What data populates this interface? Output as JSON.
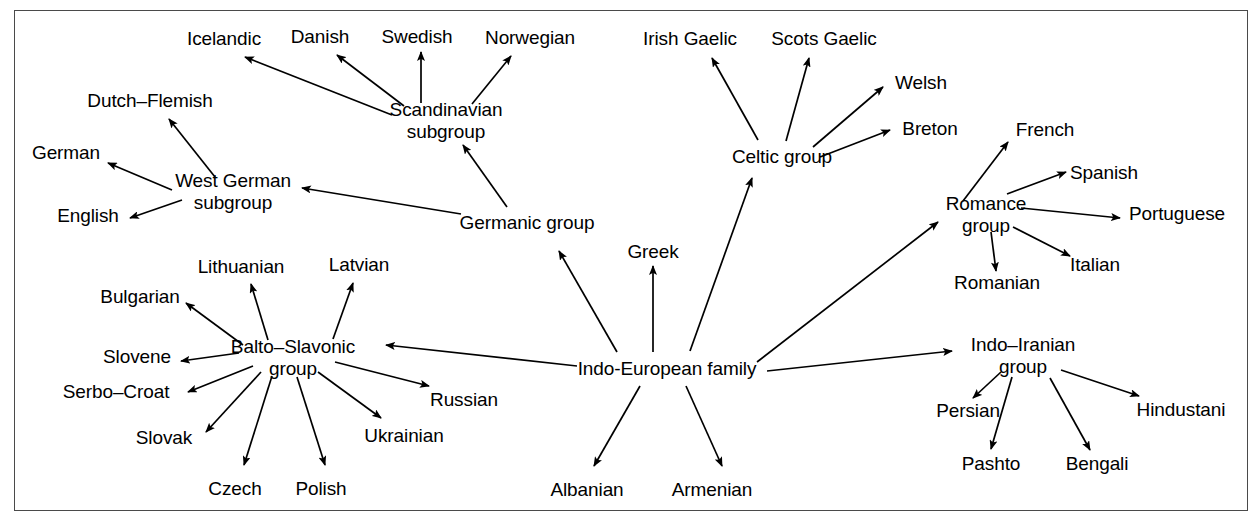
{
  "figure": {
    "type": "tree-diagram",
    "border_color": "#4a4a4a",
    "background_color": "#ffffff",
    "text_color": "#000000",
    "edge_color": "#000000"
  },
  "nodes": [
    {
      "id": "indo_european",
      "label": "Indo-European family",
      "x": 667,
      "y": 368,
      "lines": [
        "Indo-European family"
      ]
    },
    {
      "id": "germanic",
      "label": "Germanic group",
      "x": 527,
      "y": 222,
      "lines": [
        "Germanic group"
      ]
    },
    {
      "id": "scandinavian",
      "label": "Scandinavian subgroup",
      "x": 446,
      "y": 121,
      "lines": [
        "Scandinavian",
        "subgroup"
      ]
    },
    {
      "id": "icelandic",
      "label": "Icelandic",
      "x": 224,
      "y": 38,
      "lines": [
        "Icelandic"
      ]
    },
    {
      "id": "danish",
      "label": "Danish",
      "x": 320,
      "y": 36,
      "lines": [
        "Danish"
      ]
    },
    {
      "id": "swedish",
      "label": "Swedish",
      "x": 417,
      "y": 36,
      "lines": [
        "Swedish"
      ]
    },
    {
      "id": "norwegian",
      "label": "Norwegian",
      "x": 530,
      "y": 37,
      "lines": [
        "Norwegian"
      ]
    },
    {
      "id": "west_german",
      "label": "West German subgroup",
      "x": 233,
      "y": 192,
      "lines": [
        "West German",
        "subgroup"
      ]
    },
    {
      "id": "dutch_flemish",
      "label": "Dutch–Flemish",
      "x": 150,
      "y": 100,
      "lines": [
        "Dutch–Flemish"
      ]
    },
    {
      "id": "german",
      "label": "German",
      "x": 66,
      "y": 152,
      "lines": [
        "German"
      ]
    },
    {
      "id": "english",
      "label": "English",
      "x": 88,
      "y": 215,
      "lines": [
        "English"
      ]
    },
    {
      "id": "balto_slavonic",
      "label": "Balto–Slavonic group",
      "x": 293,
      "y": 358,
      "lines": [
        "Balto–Slavonic",
        "group"
      ]
    },
    {
      "id": "lithuanian",
      "label": "Lithuanian",
      "x": 241,
      "y": 266,
      "lines": [
        "Lithuanian"
      ]
    },
    {
      "id": "latvian",
      "label": "Latvian",
      "x": 359,
      "y": 264,
      "lines": [
        "Latvian"
      ]
    },
    {
      "id": "bulgarian",
      "label": "Bulgarian",
      "x": 140,
      "y": 296,
      "lines": [
        "Bulgarian"
      ]
    },
    {
      "id": "slovene",
      "label": "Slovene",
      "x": 137,
      "y": 356,
      "lines": [
        "Slovene"
      ]
    },
    {
      "id": "serbo_croat",
      "label": "Serbo–Croat",
      "x": 116,
      "y": 391,
      "lines": [
        "Serbo–Croat"
      ]
    },
    {
      "id": "slovak",
      "label": "Slovak",
      "x": 164,
      "y": 437,
      "lines": [
        "Slovak"
      ]
    },
    {
      "id": "czech",
      "label": "Czech",
      "x": 235,
      "y": 488,
      "lines": [
        "Czech"
      ]
    },
    {
      "id": "polish",
      "label": "Polish",
      "x": 321,
      "y": 488,
      "lines": [
        "Polish"
      ]
    },
    {
      "id": "ukrainian",
      "label": "Ukrainian",
      "x": 404,
      "y": 435,
      "lines": [
        "Ukrainian"
      ]
    },
    {
      "id": "russian",
      "label": "Russian",
      "x": 464,
      "y": 399,
      "lines": [
        "Russian"
      ]
    },
    {
      "id": "greek",
      "label": "Greek",
      "x": 653,
      "y": 251,
      "lines": [
        "Greek"
      ]
    },
    {
      "id": "albanian",
      "label": "Albanian",
      "x": 587,
      "y": 489,
      "lines": [
        "Albanian"
      ]
    },
    {
      "id": "armenian",
      "label": "Armenian",
      "x": 712,
      "y": 489,
      "lines": [
        "Armenian"
      ]
    },
    {
      "id": "celtic",
      "label": "Celtic group",
      "x": 782,
      "y": 156,
      "lines": [
        "Celtic group"
      ]
    },
    {
      "id": "irish_gaelic",
      "label": "Irish Gaelic",
      "x": 690,
      "y": 38,
      "lines": [
        "Irish Gaelic"
      ]
    },
    {
      "id": "scots_gaelic",
      "label": "Scots Gaelic",
      "x": 824,
      "y": 38,
      "lines": [
        "Scots Gaelic"
      ]
    },
    {
      "id": "welsh",
      "label": "Welsh",
      "x": 921,
      "y": 82,
      "lines": [
        "Welsh"
      ]
    },
    {
      "id": "breton",
      "label": "Breton",
      "x": 930,
      "y": 128,
      "lines": [
        "Breton"
      ]
    },
    {
      "id": "romance",
      "label": "Romance group",
      "x": 986,
      "y": 215,
      "lines": [
        "Romance",
        "group"
      ]
    },
    {
      "id": "french",
      "label": "French",
      "x": 1045,
      "y": 129,
      "lines": [
        "French"
      ]
    },
    {
      "id": "spanish",
      "label": "Spanish",
      "x": 1104,
      "y": 172,
      "lines": [
        "Spanish"
      ]
    },
    {
      "id": "portuguese",
      "label": "Portuguese",
      "x": 1177,
      "y": 213,
      "lines": [
        "Portuguese"
      ]
    },
    {
      "id": "italian",
      "label": "Italian",
      "x": 1095,
      "y": 264,
      "lines": [
        "Italian"
      ]
    },
    {
      "id": "romanian",
      "label": "Romanian",
      "x": 997,
      "y": 282,
      "lines": [
        "Romanian"
      ]
    },
    {
      "id": "indo_iranian",
      "label": "Indo–Iranian group",
      "x": 1023,
      "y": 356,
      "lines": [
        "Indo–Iranian",
        "group"
      ]
    },
    {
      "id": "persian",
      "label": "Persian",
      "x": 968,
      "y": 410,
      "lines": [
        "Persian"
      ]
    },
    {
      "id": "pashto",
      "label": "Pashto",
      "x": 991,
      "y": 463,
      "lines": [
        "Pashto"
      ]
    },
    {
      "id": "bengali",
      "label": "Bengali",
      "x": 1097,
      "y": 463,
      "lines": [
        "Bengali"
      ]
    },
    {
      "id": "hindustani",
      "label": "Hindustani",
      "x": 1181,
      "y": 409,
      "lines": [
        "Hindustani"
      ]
    }
  ],
  "edges": [
    {
      "from": "indo_european",
      "to": "germanic",
      "x1": 617,
      "y1": 352,
      "x2": 559,
      "y2": 251
    },
    {
      "from": "indo_european",
      "to": "greek",
      "x1": 653,
      "y1": 352,
      "x2": 653,
      "y2": 266
    },
    {
      "from": "indo_european",
      "to": "celtic",
      "x1": 690,
      "y1": 351,
      "x2": 752,
      "y2": 178
    },
    {
      "from": "indo_european",
      "to": "romance",
      "x1": 757,
      "y1": 362,
      "x2": 938,
      "y2": 222
    },
    {
      "from": "indo_european",
      "to": "indo_iranian",
      "x1": 767,
      "y1": 371,
      "x2": 952,
      "y2": 351
    },
    {
      "from": "indo_european",
      "to": "balto_slavonic",
      "x1": 577,
      "y1": 366,
      "x2": 386,
      "y2": 345
    },
    {
      "from": "indo_european",
      "to": "albanian",
      "x1": 640,
      "y1": 386,
      "x2": 594,
      "y2": 466
    },
    {
      "from": "indo_european",
      "to": "armenian",
      "x1": 686,
      "y1": 386,
      "x2": 722,
      "y2": 466
    },
    {
      "from": "germanic",
      "to": "scandinavian",
      "x1": 507,
      "y1": 207,
      "x2": 463,
      "y2": 145
    },
    {
      "from": "germanic",
      "to": "west_german",
      "x1": 461,
      "y1": 214,
      "x2": 302,
      "y2": 188
    },
    {
      "from": "scandinavian",
      "to": "icelandic",
      "x1": 392,
      "y1": 115,
      "x2": 245,
      "y2": 57
    },
    {
      "from": "scandinavian",
      "to": "danish",
      "x1": 404,
      "y1": 106,
      "x2": 337,
      "y2": 55
    },
    {
      "from": "scandinavian",
      "to": "swedish",
      "x1": 421,
      "y1": 103,
      "x2": 421,
      "y2": 52
    },
    {
      "from": "scandinavian",
      "to": "norwegian",
      "x1": 472,
      "y1": 104,
      "x2": 511,
      "y2": 56
    },
    {
      "from": "west_german",
      "to": "dutch_flemish",
      "x1": 215,
      "y1": 177,
      "x2": 169,
      "y2": 119
    },
    {
      "from": "west_german",
      "to": "german",
      "x1": 172,
      "y1": 190,
      "x2": 108,
      "y2": 163
    },
    {
      "from": "west_german",
      "to": "english",
      "x1": 182,
      "y1": 200,
      "x2": 130,
      "y2": 218
    },
    {
      "from": "balto_slavonic",
      "to": "lithuanian",
      "x1": 268,
      "y1": 340,
      "x2": 251,
      "y2": 284
    },
    {
      "from": "balto_slavonic",
      "to": "latvian",
      "x1": 333,
      "y1": 339,
      "x2": 353,
      "y2": 283
    },
    {
      "from": "balto_slavonic",
      "to": "bulgarian",
      "x1": 243,
      "y1": 345,
      "x2": 186,
      "y2": 303
    },
    {
      "from": "balto_slavonic",
      "to": "slovene",
      "x1": 239,
      "y1": 353,
      "x2": 181,
      "y2": 361
    },
    {
      "from": "balto_slavonic",
      "to": "serbo_croat",
      "x1": 253,
      "y1": 366,
      "x2": 188,
      "y2": 392
    },
    {
      "from": "balto_slavonic",
      "to": "slovak",
      "x1": 261,
      "y1": 372,
      "x2": 206,
      "y2": 432
    },
    {
      "from": "balto_slavonic",
      "to": "czech",
      "x1": 272,
      "y1": 376,
      "x2": 244,
      "y2": 465
    },
    {
      "from": "balto_slavonic",
      "to": "polish",
      "x1": 297,
      "y1": 377,
      "x2": 325,
      "y2": 465
    },
    {
      "from": "balto_slavonic",
      "to": "ukrainian",
      "x1": 318,
      "y1": 372,
      "x2": 381,
      "y2": 418
    },
    {
      "from": "balto_slavonic",
      "to": "russian",
      "x1": 335,
      "y1": 362,
      "x2": 429,
      "y2": 386
    },
    {
      "from": "celtic",
      "to": "irish_gaelic",
      "x1": 758,
      "y1": 140,
      "x2": 712,
      "y2": 58
    },
    {
      "from": "celtic",
      "to": "scots_gaelic",
      "x1": 786,
      "y1": 141,
      "x2": 809,
      "y2": 58
    },
    {
      "from": "celtic",
      "to": "welsh",
      "x1": 813,
      "y1": 147,
      "x2": 883,
      "y2": 87
    },
    {
      "from": "celtic",
      "to": "breton",
      "x1": 820,
      "y1": 157,
      "x2": 890,
      "y2": 130
    },
    {
      "from": "romance",
      "to": "french",
      "x1": 963,
      "y1": 201,
      "x2": 1008,
      "y2": 142
    },
    {
      "from": "romance",
      "to": "spanish",
      "x1": 1007,
      "y1": 194,
      "x2": 1066,
      "y2": 172
    },
    {
      "from": "romance",
      "to": "portuguese",
      "x1": 1021,
      "y1": 208,
      "x2": 1120,
      "y2": 218
    },
    {
      "from": "romance",
      "to": "italian",
      "x1": 1013,
      "y1": 227,
      "x2": 1070,
      "y2": 256
    },
    {
      "from": "romance",
      "to": "romanian",
      "x1": 991,
      "y1": 232,
      "x2": 996,
      "y2": 271
    },
    {
      "from": "indo_iranian",
      "to": "persian",
      "x1": 1001,
      "y1": 372,
      "x2": 973,
      "y2": 398
    },
    {
      "from": "indo_iranian",
      "to": "pashto",
      "x1": 1012,
      "y1": 377,
      "x2": 991,
      "y2": 449
    },
    {
      "from": "indo_iranian",
      "to": "bengali",
      "x1": 1050,
      "y1": 378,
      "x2": 1090,
      "y2": 450
    },
    {
      "from": "indo_iranian",
      "to": "hindustani",
      "x1": 1061,
      "y1": 370,
      "x2": 1139,
      "y2": 396
    }
  ]
}
